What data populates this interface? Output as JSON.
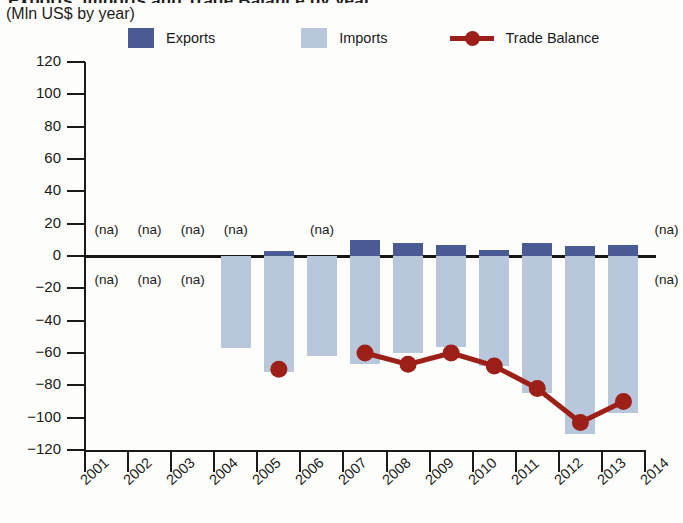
{
  "title": {
    "main_clipped": "Exports, Imports and Trade Balance by year",
    "units": "(Mln US$ by year)"
  },
  "legend": {
    "position": "top",
    "items": [
      {
        "label": "Exports",
        "type": "swatch",
        "color": "#4a5a93"
      },
      {
        "label": "Imports",
        "type": "swatch",
        "color": "#b9c7dc"
      },
      {
        "label": "Trade Balance",
        "type": "line-marker",
        "color": "#9c1f18"
      }
    ]
  },
  "axes": {
    "y_ticks": [
      "120",
      "100",
      "80",
      "60",
      "40",
      "20",
      "0",
      "−20",
      "−40",
      "−60",
      "−80",
      "−100",
      "−120"
    ],
    "x_ticks": [
      "2001",
      "2002",
      "2003",
      "2004",
      "2005",
      "2006",
      "2007",
      "2008",
      "2009",
      "2010",
      "2011",
      "2012",
      "2013",
      "2014"
    ],
    "na_text": "(na)"
  },
  "chart_data": {
    "type": "bar",
    "title": "Exports, Imports and Trade Balance by year",
    "subtitle": "(Mln US$ by year)",
    "xlabel": "",
    "ylabel": "Mln US$",
    "ylim": [
      -120,
      120
    ],
    "ytick_step": 20,
    "grid": false,
    "legend_position": "top",
    "categories": [
      "2001",
      "2002",
      "2003",
      "2004",
      "2005",
      "2006",
      "2007",
      "2008",
      "2009",
      "2010",
      "2011",
      "2012",
      "2013",
      "2014"
    ],
    "series": [
      {
        "name": "Exports",
        "type": "bar",
        "color": "#4a5a93",
        "values": [
          null,
          null,
          null,
          null,
          3,
          null,
          10,
          8,
          7,
          4,
          8,
          6,
          7,
          null
        ]
      },
      {
        "name": "Imports",
        "type": "bar",
        "color": "#b9c7dc",
        "values": [
          null,
          null,
          null,
          -57,
          -72,
          -62,
          -67,
          -60,
          -56,
          -68,
          -85,
          -110,
          -97,
          null
        ]
      },
      {
        "name": "Trade Balance",
        "type": "line",
        "color": "#9c1f18",
        "values": [
          null,
          null,
          null,
          null,
          -70,
          null,
          -60,
          -67,
          -60,
          -68,
          -82,
          -103,
          -90,
          null
        ]
      }
    ],
    "na_markers": {
      "above_axis_years": [
        "2001",
        "2002",
        "2003",
        "2004",
        "2006",
        "2014"
      ],
      "below_axis_years": [
        "2001",
        "2002",
        "2003",
        "2014"
      ]
    }
  }
}
